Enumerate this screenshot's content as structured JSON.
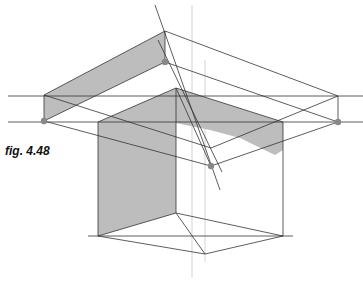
{
  "figure": {
    "caption": "fig. 4.48",
    "colors": {
      "background": "#ffffff",
      "line": "#333333",
      "construction_line": "#bbbbbb",
      "shade": "#bdbdbd",
      "point": "#888888"
    }
  }
}
